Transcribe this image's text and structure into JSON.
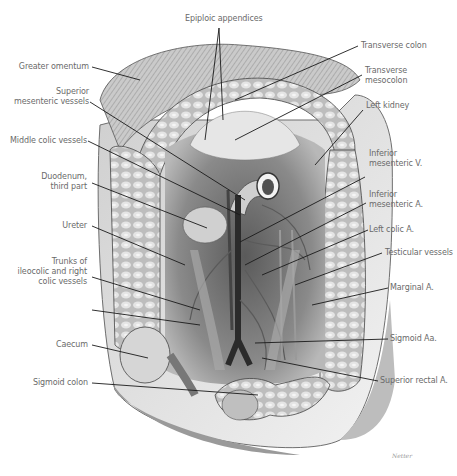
{
  "figure": {
    "type": "anatomical illustration",
    "signature": "Netter"
  },
  "labels_top": [
    {
      "id": "epiploic-appendices",
      "text": "Epiploic appendices"
    }
  ],
  "labels_left": [
    {
      "id": "greater-omentum",
      "text": "Greater omentum"
    },
    {
      "id": "superior-mesenteric-vessels",
      "line1": "Superior",
      "line2": "mesenteric vessels"
    },
    {
      "id": "middle-colic-vessels",
      "text": "Middle colic vessels"
    },
    {
      "id": "duodenum-third-part",
      "line1": "Duodenum,",
      "line2": "third part"
    },
    {
      "id": "ureter",
      "text": "Ureter"
    },
    {
      "id": "trunks-ileocolic",
      "line1": "Trunks of",
      "line2": "ileocolic and right",
      "line3": "colic vessels"
    },
    {
      "id": "caecum",
      "text": "Caecum"
    },
    {
      "id": "sigmoid-colon",
      "text": "Sigmoid colon"
    }
  ],
  "labels_right": [
    {
      "id": "transverse-colon",
      "text": "Transverse colon"
    },
    {
      "id": "transverse-mesocolon",
      "line1": "Transverse",
      "line2": "mesocolon"
    },
    {
      "id": "left-kidney",
      "text": "Left kidney"
    },
    {
      "id": "inferior-mesenteric-v",
      "line1": "Inferior",
      "line2": "mesenteric V."
    },
    {
      "id": "inferior-mesenteric-a",
      "line1": "Inferior",
      "line2": "mesenteric A."
    },
    {
      "id": "left-colic-a",
      "text": "Left colic A."
    },
    {
      "id": "testicular-vessels",
      "text": "Testicular vessels"
    },
    {
      "id": "marginal-a",
      "text": "Marginal A."
    },
    {
      "id": "sigmoid-aa",
      "text": "Sigmoid Aa."
    },
    {
      "id": "superior-rectal-a",
      "text": "Superior rectal A."
    }
  ],
  "colors": {
    "background": "#ffffff",
    "label_text": "#6a6a6a",
    "leader_line": "#1a1a1a",
    "tissue_light": "#d8d8d8",
    "tissue_mid": "#a0a0a0",
    "tissue_dark": "#3a3a3a"
  }
}
